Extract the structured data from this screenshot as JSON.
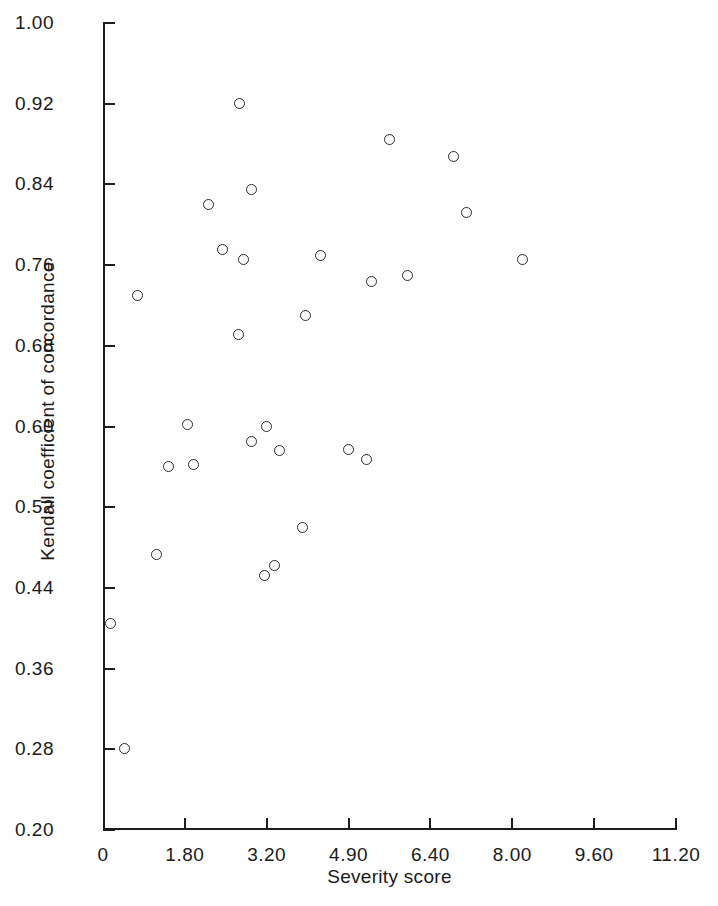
{
  "chart_data": {
    "type": "scatter",
    "title": "",
    "xlabel": "Severity score",
    "ylabel": "Kendall coefficient of concordance",
    "xlim": [
      0,
      11.2
    ],
    "ylim": [
      0.2,
      1.0
    ],
    "grid": false,
    "legend": null,
    "marker_style": "open-circle",
    "xticks": [
      {
        "value": 0,
        "label": "0"
      },
      {
        "value": 1.6,
        "label": "1.80"
      },
      {
        "value": 3.2,
        "label": "3.20"
      },
      {
        "value": 4.8,
        "label": "4.90"
      },
      {
        "value": 6.4,
        "label": "6.40"
      },
      {
        "value": 8.0,
        "label": "8.00"
      },
      {
        "value": 9.6,
        "label": "9.60"
      },
      {
        "value": 11.2,
        "label": "11.20"
      }
    ],
    "yticks": [
      {
        "value": 1.0,
        "label": "1.00"
      },
      {
        "value": 0.92,
        "label": "0.92"
      },
      {
        "value": 0.84,
        "label": "0.84"
      },
      {
        "value": 0.76,
        "label": "0.76"
      },
      {
        "value": 0.68,
        "label": "0.68"
      },
      {
        "value": 0.6,
        "label": "0.60"
      },
      {
        "value": 0.52,
        "label": "0.52"
      },
      {
        "value": 0.44,
        "label": "0.44"
      },
      {
        "value": 0.36,
        "label": "0.36"
      },
      {
        "value": 0.28,
        "label": "0.28"
      },
      {
        "value": 0.2,
        "label": "0.20"
      }
    ],
    "points": [
      {
        "x": 0.14,
        "y": 0.405
      },
      {
        "x": 0.43,
        "y": 0.281
      },
      {
        "x": 0.67,
        "y": 0.73
      },
      {
        "x": 1.05,
        "y": 0.473
      },
      {
        "x": 1.29,
        "y": 0.56
      },
      {
        "x": 1.66,
        "y": 0.602
      },
      {
        "x": 1.76,
        "y": 0.562
      },
      {
        "x": 2.07,
        "y": 0.82
      },
      {
        "x": 2.34,
        "y": 0.775
      },
      {
        "x": 2.67,
        "y": 0.92
      },
      {
        "x": 2.65,
        "y": 0.691
      },
      {
        "x": 2.75,
        "y": 0.766
      },
      {
        "x": 2.9,
        "y": 0.835
      },
      {
        "x": 2.9,
        "y": 0.585
      },
      {
        "x": 3.15,
        "y": 0.452
      },
      {
        "x": 3.2,
        "y": 0.6
      },
      {
        "x": 3.35,
        "y": 0.462
      },
      {
        "x": 3.45,
        "y": 0.576
      },
      {
        "x": 3.9,
        "y": 0.5
      },
      {
        "x": 3.95,
        "y": 0.71
      },
      {
        "x": 4.25,
        "y": 0.77
      },
      {
        "x": 4.8,
        "y": 0.577
      },
      {
        "x": 5.15,
        "y": 0.567
      },
      {
        "x": 5.25,
        "y": 0.744
      },
      {
        "x": 5.6,
        "y": 0.885
      },
      {
        "x": 5.95,
        "y": 0.75
      },
      {
        "x": 6.85,
        "y": 0.868
      },
      {
        "x": 7.1,
        "y": 0.812
      },
      {
        "x": 8.2,
        "y": 0.766
      }
    ]
  }
}
